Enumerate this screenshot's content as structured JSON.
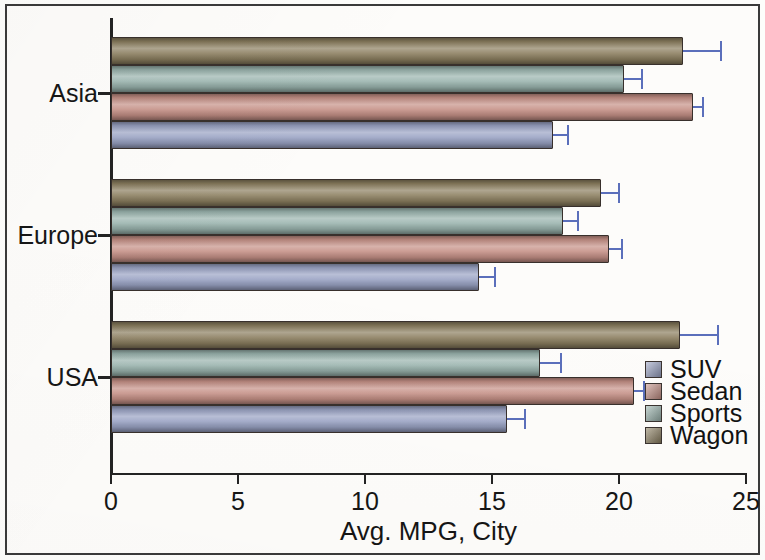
{
  "chart_data": {
    "type": "bar",
    "orientation": "horizontal",
    "title": "",
    "xlabel": "Avg. MPG, City",
    "ylabel": "",
    "xlim": [
      0,
      25
    ],
    "xticks": [
      0,
      5,
      10,
      15,
      20,
      25
    ],
    "xtick_labels": [
      "0",
      "5",
      "10",
      "15",
      "20",
      "25"
    ],
    "categories": [
      "USA",
      "Europe",
      "Asia"
    ],
    "grid": false,
    "legend_position": "lower right",
    "error_bars": "standard error",
    "series": [
      {
        "name": "SUV",
        "color": "#9aa3c4",
        "values": [
          15.6,
          14.5,
          17.4
        ],
        "errors": [
          0.7,
          0.6,
          0.6
        ]
      },
      {
        "name": "Sedan",
        "color": "#c69187",
        "values": [
          20.6,
          19.6,
          22.9
        ],
        "errors": [
          0.4,
          0.5,
          0.4
        ]
      },
      {
        "name": "Sports",
        "color": "#9ab4ae",
        "values": [
          16.9,
          17.8,
          20.2
        ],
        "errors": [
          0.8,
          0.6,
          0.7
        ]
      },
      {
        "name": "Wagon",
        "color": "#8c7f60",
        "values": [
          22.4,
          19.3,
          22.5
        ],
        "errors": [
          1.5,
          0.7,
          1.5
        ]
      }
    ]
  },
  "axis": {
    "x_title": "Avg. MPG, City",
    "x_tick_labels": [
      "0",
      "5",
      "10",
      "15",
      "20",
      "25"
    ],
    "y_tick_labels": [
      "Asia",
      "Europe",
      "USA"
    ]
  },
  "legend": {
    "items": [
      {
        "label": "SUV",
        "color": "#9aa3c4"
      },
      {
        "label": "Sedan",
        "color": "#c69187"
      },
      {
        "label": "Sports",
        "color": "#9ab4ae"
      },
      {
        "label": "Wagon",
        "color": "#8c7f60"
      }
    ]
  },
  "colors": {
    "suv": "#9aa3c4",
    "sedan": "#c69187",
    "sports": "#9ab4ae",
    "wagon": "#8c7f60",
    "error_bar": "#5b6fbb",
    "axis": "#232323",
    "frame": "#3a3a3a",
    "text": "#151515"
  }
}
